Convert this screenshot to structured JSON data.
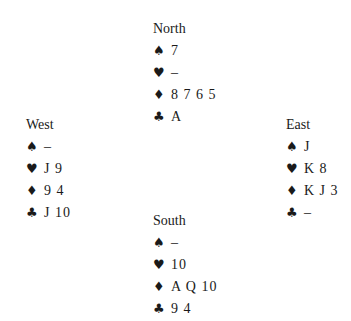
{
  "suit_symbols": {
    "spades": "♠",
    "hearts": "♥",
    "diamonds": "♦",
    "clubs": "♣"
  },
  "hands": {
    "north": {
      "name": "North",
      "spades": "7",
      "hearts": "–",
      "diamonds": "8 7 6 5",
      "clubs": "A"
    },
    "west": {
      "name": "West",
      "spades": "–",
      "hearts": "J 9",
      "diamonds": "9 4",
      "clubs": "J 10"
    },
    "east": {
      "name": "East",
      "spades": "J",
      "hearts": "K 8",
      "diamonds": "K J 3",
      "clubs": "–"
    },
    "south": {
      "name": "South",
      "spades": "–",
      "hearts": "10",
      "diamonds": "A Q 10",
      "clubs": "9 4"
    }
  }
}
